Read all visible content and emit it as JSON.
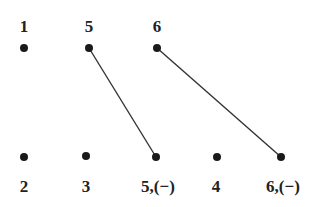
{
  "diagram": {
    "top_row": [
      {
        "label": "1",
        "x": 24,
        "y": 48
      },
      {
        "label": "5",
        "x": 89,
        "y": 48
      },
      {
        "label": "6",
        "x": 157,
        "y": 48
      }
    ],
    "bottom_row": [
      {
        "label": "2",
        "x": 24,
        "y": 157
      },
      {
        "label": "3",
        "x": 86,
        "y": 156
      },
      {
        "label": "5,(−)",
        "x": 156,
        "y": 157
      },
      {
        "label": "4",
        "x": 217,
        "y": 157
      },
      {
        "label": "6,(−)",
        "x": 281,
        "y": 157
      }
    ],
    "edges": [
      {
        "from": "top 5",
        "to": "bottom 5,(−)"
      },
      {
        "from": "top 6",
        "to": "bottom 6,(−)"
      }
    ],
    "colors": {
      "node": "#1a1a1a",
      "edge": "#333333",
      "text": "#222222"
    }
  }
}
